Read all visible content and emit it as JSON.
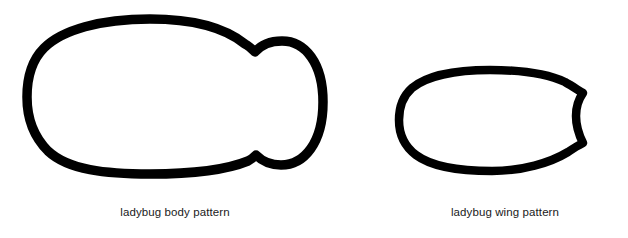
{
  "document": {
    "title": "ladybug patterns",
    "background_color": "#ffffff",
    "stroke_color": "#000000",
    "text_color": "#1a1a1a",
    "width": 628,
    "height": 238
  },
  "figures": [
    {
      "id": "body",
      "name": "ladybug-body-pattern",
      "caption": "ladybug body pattern",
      "description": "large rounded oval body with rounded head lobe protruding at right, joined by concave notches",
      "stroke_width": 9.5,
      "bounds": {
        "x": 27,
        "y": 15,
        "width": 301,
        "height": 163
      }
    },
    {
      "id": "wing",
      "name": "ladybug-wing-pattern",
      "caption": "ladybug wing pattern",
      "description": "teardrop wing with rounded left end tapering to a slightly concave near-vertical right edge",
      "stroke_width": 8.5,
      "bounds": {
        "x": 398,
        "y": 66,
        "width": 192,
        "height": 109
      }
    }
  ],
  "captions": {
    "body": "ladybug body pattern",
    "wing": "ladybug wing pattern"
  }
}
